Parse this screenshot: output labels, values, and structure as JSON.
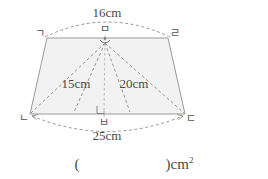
{
  "figure": {
    "shape_name": "trapezoid",
    "fill_color": "#f2f2f2",
    "stroke_color": "#9a9a9a",
    "dashed_color": "#8a8a8a",
    "vertices": {
      "top_left": "ㄱ",
      "top_mid": "ㅁ",
      "top_right": "ㄹ",
      "bottom_left": "ㄴ",
      "bottom_mid": "ㅂ",
      "bottom_right": "ㄷ"
    },
    "dimensions": {
      "top_side": "16cm",
      "bottom_side": "25cm",
      "left_diagonal": "15cm",
      "right_diagonal": "20cm"
    }
  },
  "answer": {
    "open_paren": "(",
    "value": "",
    "close_paren": ")",
    "unit_base": "cm",
    "unit_exponent": "2"
  }
}
